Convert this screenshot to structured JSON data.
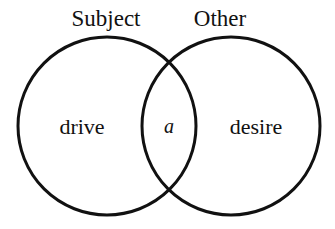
{
  "figure": {
    "kind": "venn-diagram",
    "background_color": "#ffffff",
    "stroke_color": "#111111",
    "stroke_width": 3,
    "width": 335,
    "height": 229
  },
  "sets": {
    "left": {
      "label": "Subject",
      "label_x": 106,
      "label_y": 26,
      "center_x": 107,
      "center_y": 126,
      "radius": 89
    },
    "right": {
      "label": "Other",
      "label_x": 220,
      "label_y": 26,
      "center_x": 231,
      "center_y": 126,
      "radius": 89
    }
  },
  "regions": [
    {
      "name": "left-only",
      "label": "drive",
      "x": 82,
      "y": 134,
      "italic": false
    },
    {
      "name": "intersection",
      "label": "a",
      "x": 169,
      "y": 133,
      "italic": true
    },
    {
      "name": "right-only",
      "label": "desire",
      "x": 256,
      "y": 134,
      "italic": false
    }
  ]
}
